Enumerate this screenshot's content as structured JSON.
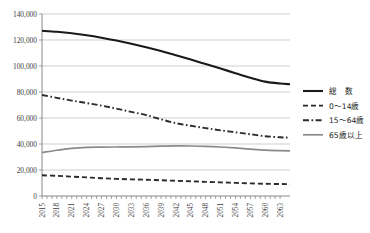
{
  "chart_data": {
    "type": "line",
    "title": "",
    "subtitle": "",
    "xlabel": "",
    "ylabel": "",
    "grid": true,
    "legend_position": "right",
    "xlim": [
      2015,
      2065
    ],
    "ylim": [
      0,
      140000
    ],
    "y_ticks": [
      0,
      20000,
      40000,
      60000,
      80000,
      100000,
      120000,
      140000
    ],
    "y_tick_labels": [
      "0",
      "20,000",
      "40,000",
      "60,000",
      "80,000",
      "100,000",
      "120,000",
      "140,000"
    ],
    "x_tick_labels": [
      "2015",
      "2018",
      "2021",
      "2024",
      "2027",
      "2030",
      "2033",
      "2036",
      "2039",
      "2042",
      "2045",
      "2048",
      "2051",
      "2054",
      "2057",
      "2060",
      "2063"
    ],
    "x": [
      2015,
      2018,
      2021,
      2024,
      2027,
      2030,
      2033,
      2036,
      2039,
      2042,
      2045,
      2048,
      2051,
      2054,
      2057,
      2060,
      2063,
      2065
    ],
    "series": [
      {
        "name": "総　数",
        "legend_label": "総　数",
        "style": "solid",
        "color": "#1a1a1a",
        "width": 2.1,
        "values": [
          127100,
          126300,
          125200,
          123700,
          121800,
          119600,
          117100,
          114400,
          111500,
          108300,
          105000,
          101500,
          98000,
          94500,
          91000,
          88000,
          86500,
          86000
        ]
      },
      {
        "name": "0〜14歳",
        "legend_label": "0〜14歳",
        "style": "dashed",
        "color": "#2b2b2b",
        "width": 1.9,
        "values": [
          15950,
          15500,
          14900,
          14300,
          13700,
          13200,
          12800,
          12500,
          12100,
          11700,
          11300,
          10900,
          10500,
          10100,
          9700,
          9400,
          9200,
          9100
        ]
      },
      {
        "name": "15〜64歳",
        "legend_label": "15〜64歳",
        "style": "dashdot",
        "color": "#2b2b2b",
        "width": 1.9,
        "values": [
          77700,
          75500,
          73400,
          71500,
          69500,
          67200,
          64700,
          62200,
          59000,
          56000,
          54000,
          52200,
          50500,
          49000,
          47500,
          46000,
          45200,
          44800
        ]
      },
      {
        "name": "65歳以上",
        "legend_label": "65歳以上",
        "style": "solid",
        "color": "#8a8a8a",
        "width": 1.7,
        "values": [
          33450,
          35200,
          36700,
          37400,
          37600,
          37700,
          37800,
          38000,
          38300,
          38500,
          38450,
          38200,
          37700,
          37000,
          36100,
          35300,
          34900,
          34700
        ]
      }
    ]
  },
  "legend": {
    "items": [
      {
        "label": "総　数"
      },
      {
        "label": "0〜14歳"
      },
      {
        "label": "15〜64歳"
      },
      {
        "label": "65歳以上"
      }
    ]
  }
}
